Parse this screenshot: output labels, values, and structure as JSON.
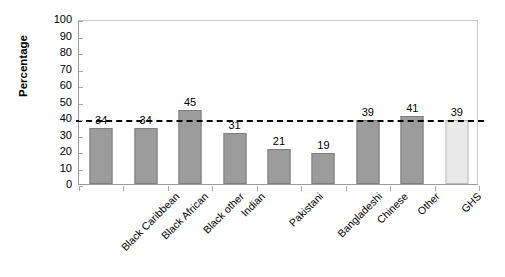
{
  "chart_data": {
    "type": "bar",
    "title": "",
    "subtitle": "",
    "xlabel": "",
    "ylabel": "Percentage",
    "ylim": [
      0,
      100
    ],
    "ytick_step": 10,
    "yticks": [
      100,
      90,
      80,
      70,
      60,
      50,
      40,
      30,
      20,
      10,
      0
    ],
    "grid": false,
    "legend": "none",
    "categories": [
      "Black Caribbean",
      "Black African",
      "Black other",
      "Indian",
      "Pakistani",
      "Bangladeshi",
      "Chinese",
      "Other",
      "GHS"
    ],
    "values": [
      34,
      34,
      45,
      31,
      21,
      19,
      39,
      41,
      39
    ],
    "data_labels": [
      "34",
      "34",
      "45",
      "31",
      "21",
      "19",
      "39",
      "41",
      "39"
    ],
    "bar_colors": [
      "#9c9c9c",
      "#9c9c9c",
      "#9c9c9c",
      "#9c9c9c",
      "#9c9c9c",
      "#9c9c9c",
      "#9c9c9c",
      "#9c9c9c",
      "#e9e9e9"
    ],
    "reference_line": {
      "value": 40,
      "style": "dashed",
      "color": "#000000",
      "label": ""
    },
    "colors": {
      "bar_fill": "#9c9c9c",
      "bar_border": "#7d7d7d",
      "highlight_fill": "#e9e9e9",
      "highlight_border": "#b9b9b9",
      "axis": "#9a9a9a",
      "frame": "#c9c9c9",
      "text": "#000000",
      "background": "#ffffff"
    }
  }
}
